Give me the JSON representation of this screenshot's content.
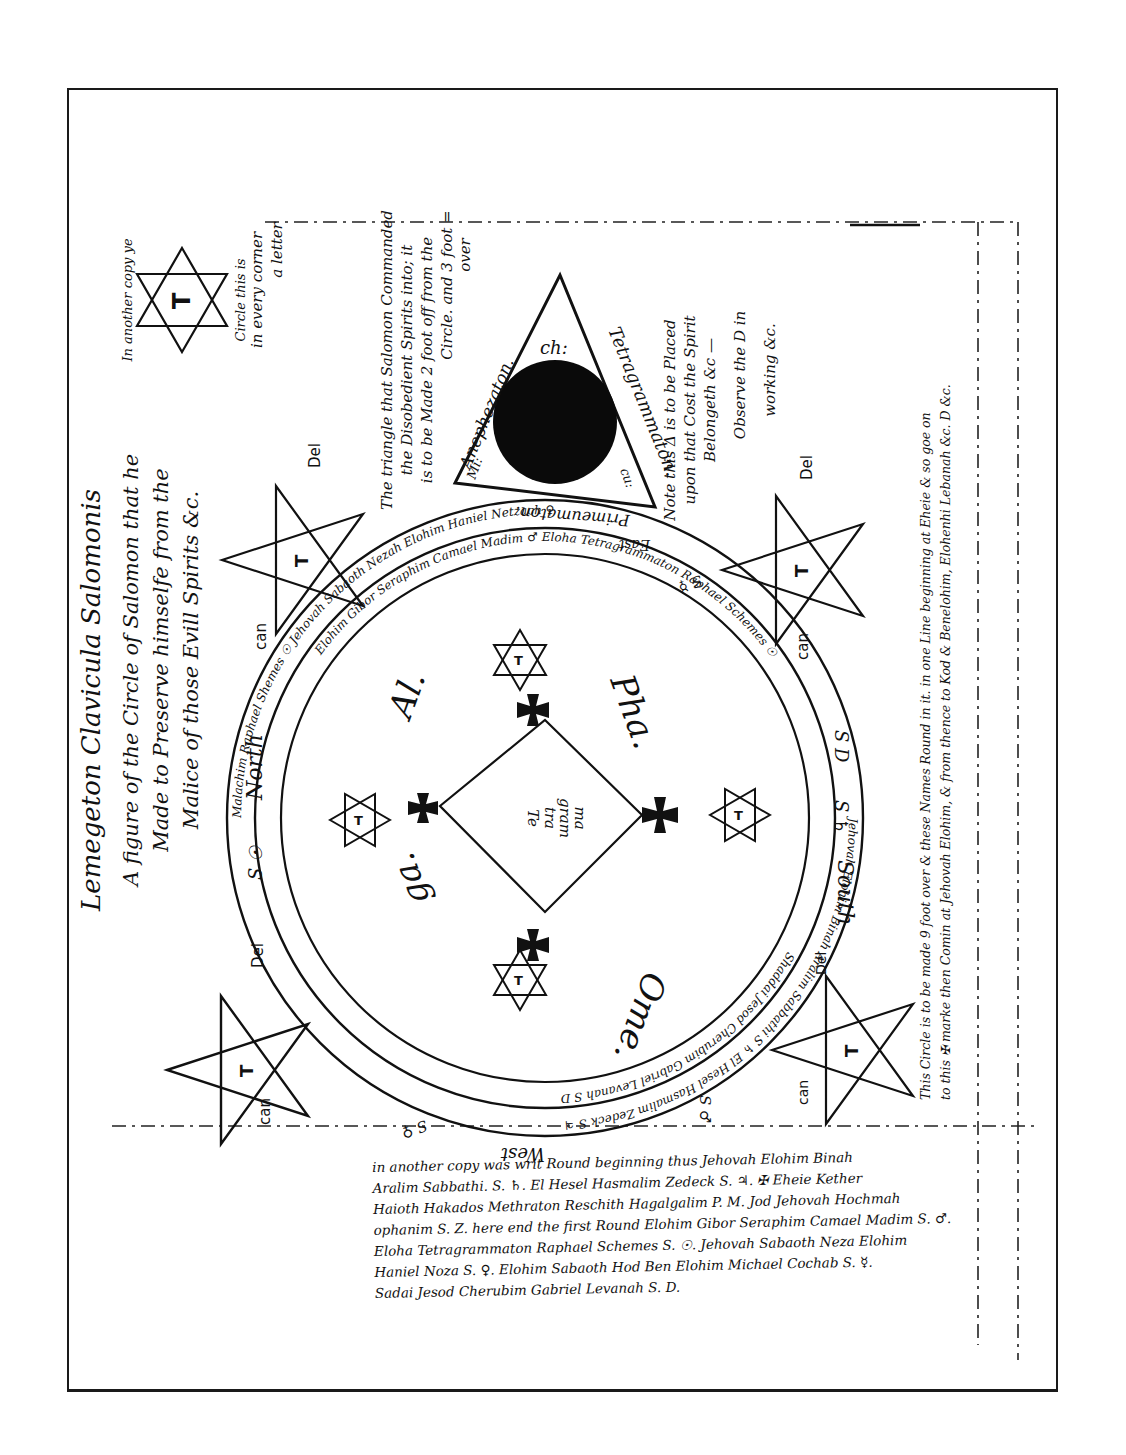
{
  "document": {
    "title": "Lemegeton Clavicula Salomonis",
    "heading_lines": [
      "A figure of the Circle of Salomon that he",
      "Made to Preserve himselfe from the",
      "Malice of those Evill Spirits &c."
    ],
    "compass": {
      "north": "North",
      "north_sign": "S ☉",
      "south": "South",
      "south_sign": "S ♄",
      "west": "West",
      "west_sign": "S ♀",
      "east": "East",
      "east_sign": "S ☿",
      "se_sign": "S D",
      "sw_sign": "S ♂"
    },
    "triangle": {
      "top_label": "ch:",
      "right_side": "Tetragrammaton.",
      "left_side": "Anephezaton.",
      "bottom_side": "Primeumaton.",
      "left_corner": "Mi:",
      "right_corner": "cu:",
      "note_left": [
        "The triangle that Salomon Commanded",
        "the Disobedient Spirits into; it",
        "is to be Made 2 foot off from the",
        "Circle. and 3 foot =",
        "over"
      ],
      "note_right": [
        "Note this Δ is to be Placed",
        "upon that Cost the Spirit",
        "Belongeth &c —",
        "Observe the D in",
        "working &c."
      ]
    },
    "hexagram_note": [
      "In another copy ye",
      "Circle this is",
      "in every corner",
      "a letter"
    ],
    "hexagram_letters": [
      "T",
      "A",
      "D",
      "O",
      "N",
      "A",
      "I"
    ],
    "pentagrams": [
      {
        "position": "top-left",
        "center": "T",
        "labels": [
          "Te",
          "tra",
          "gram",
          "ma",
          "ton",
          "can",
          "Del"
        ]
      },
      {
        "position": "top-right",
        "center": "T",
        "labels": [
          "te",
          "tra",
          "gram",
          "ma",
          "ton",
          "can",
          "Del"
        ]
      },
      {
        "position": "bottom-left",
        "center": "T",
        "labels": [
          "te",
          "tra",
          "gram",
          "ma",
          "ton",
          "can",
          "Del"
        ]
      },
      {
        "position": "bottom-right",
        "center": "T",
        "labels": [
          "te",
          "tra",
          "gram",
          "ma",
          "ton",
          "can",
          "Del"
        ]
      }
    ],
    "circle": {
      "quadrant_words": [
        "Al.",
        "Pha.",
        "Ome.",
        "ga."
      ],
      "center_text": [
        "Te",
        "tra",
        "gram",
        "ma",
        "ton"
      ],
      "ring_text": [
        "Malachim Raphael Shemes ☉ Jehovah Sabaoth Nezah Elohim Haniel Netzach ♀",
        "Elohim Gibor Seraphim Camael Madim ♂ Eloha Tetragrammaton Raphael Schemes ☉",
        "Jehovah Elohim Binah Aralim Sabbathi S ♄ El Hesel Hasmalim Zedeck S ♃",
        "Shaddai Jesod Cherubim Gabriel Levanah S D"
      ]
    },
    "right_margin_note": [
      "This Circle is to be made 9 foot over & these Names Round in it. in one Line beginning at Eheie & so goe on",
      "to this ✠ marke then Comin at Jehovah Elohim, & from thence to Kod & Benelohim, Elohenhi Lebanah &c. D &c."
    ],
    "bottom_note": [
      "in another copy was writ Round beginning thus Jehovah Elohim Binah",
      "Aralim Sabbathi. S. ♄. El Hesel Hasmalim Zedeck S. ♃. ✠ Eheie Kether",
      "Haioth Hakados Methraton Reschith Hagalgalim P. M. Jod Jehovah Hochmah",
      "ophanim S. Z. here end the first Round Elohim Gibor Seraphim Camael Madim S. ♂.",
      "Eloha Tetragrammaton Raphael Schemes S. ☉. Jehovah Sabaoth Neza Elohim",
      "Haniel Noza S. ♀. Elohim Sabaoth Hod Ben Elohim Michael Cochab S. ☿.",
      "Sadai Jesod Cherubim Gabriel Levanah S. D."
    ]
  }
}
